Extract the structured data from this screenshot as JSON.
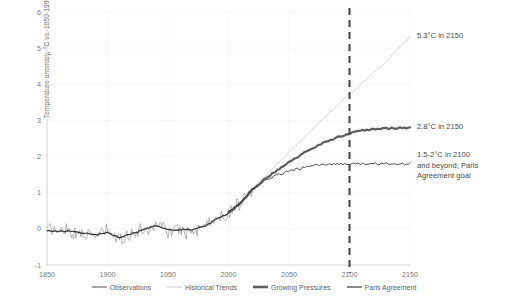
{
  "chart_data": {
    "type": "line",
    "title": "",
    "xlabel": "",
    "ylabel": "Temperature anomaly, °C vs. 1850-1900",
    "xlim": [
      1850,
      2150
    ],
    "ylim": [
      -1,
      6
    ],
    "xticks": [
      1850,
      1900,
      1950,
      2000,
      2050,
      2100,
      2150
    ],
    "yticks": [
      -1,
      0,
      1,
      2,
      3,
      4,
      5,
      6
    ],
    "grid": "faint-horizontal-and-vertical",
    "legend_position": "bottom-center",
    "reference_line": {
      "name": "year-2100-marker",
      "x": 2100,
      "style": "dashed",
      "color": "#4a4a4a"
    },
    "series": [
      {
        "name": "Observations",
        "color": "#8c8c8c",
        "width": 0.6,
        "style": "solid-noisy",
        "x_start": 1850,
        "x_end": 2020,
        "description": "Annual observed global temperature anomaly, noisy",
        "x": [
          1850,
          1855,
          1860,
          1865,
          1870,
          1875,
          1880,
          1885,
          1890,
          1895,
          1900,
          1905,
          1910,
          1915,
          1920,
          1925,
          1930,
          1935,
          1940,
          1945,
          1950,
          1955,
          1960,
          1965,
          1970,
          1975,
          1980,
          1985,
          1990,
          1995,
          2000,
          2005,
          2010,
          2015,
          2020
        ],
        "values": [
          -0.05,
          0.02,
          -0.12,
          0.05,
          -0.08,
          -0.18,
          -0.05,
          -0.22,
          -0.18,
          -0.12,
          -0.02,
          -0.22,
          -0.32,
          -0.18,
          -0.12,
          -0.08,
          0.02,
          -0.05,
          0.18,
          0.12,
          -0.08,
          -0.08,
          0.02,
          -0.12,
          0.05,
          -0.05,
          0.22,
          0.12,
          0.38,
          0.32,
          0.45,
          0.62,
          0.72,
          0.92,
          1.12
        ]
      },
      {
        "name": "Observations smoothed",
        "color": "#3a3a3a",
        "width": 1.3,
        "style": "solid",
        "description": "Smoothed running mean over the observations",
        "x": [
          1850,
          1860,
          1870,
          1880,
          1890,
          1900,
          1910,
          1920,
          1930,
          1940,
          1950,
          1960,
          1970,
          1980,
          1990,
          2000,
          2010,
          2020
        ],
        "values": [
          -0.04,
          -0.06,
          -0.06,
          -0.12,
          -0.16,
          -0.1,
          -0.24,
          -0.14,
          -0.02,
          0.1,
          -0.04,
          -0.02,
          -0.02,
          0.08,
          0.26,
          0.44,
          0.7,
          1.08
        ]
      },
      {
        "name": "Historical Trends",
        "color": "#c9c9c9",
        "width": 0.7,
        "style": "solid",
        "description": "Extrapolated historical trend projection to 2150",
        "x": [
          2000,
          2010,
          2020,
          2030,
          2040,
          2050,
          2060,
          2070,
          2080,
          2090,
          2100,
          2110,
          2120,
          2130,
          2140,
          2150
        ],
        "values": [
          0.45,
          0.72,
          1.1,
          1.45,
          1.78,
          2.12,
          2.45,
          2.78,
          3.1,
          3.42,
          3.72,
          4.02,
          4.32,
          4.62,
          4.98,
          5.3
        ],
        "endpoint_label": "5.3°C in 2150"
      },
      {
        "name": "Growing Pressures",
        "color": "#5e5e5e",
        "width": 2.2,
        "style": "solid",
        "description": "Moderate-mitigation scenario plateauing near 2.8°C",
        "x": [
          2000,
          2010,
          2020,
          2030,
          2040,
          2050,
          2060,
          2070,
          2080,
          2090,
          2100,
          2110,
          2120,
          2130,
          2140,
          2150
        ],
        "values": [
          0.45,
          0.72,
          1.1,
          1.38,
          1.62,
          1.85,
          2.05,
          2.24,
          2.4,
          2.54,
          2.64,
          2.72,
          2.76,
          2.78,
          2.79,
          2.8
        ],
        "endpoint_label": "2.8°C in 2150"
      },
      {
        "name": "Paris Agreement",
        "color": "#3a3a3a",
        "width": 0.9,
        "style": "solid",
        "description": "Paris-compatible pathway stabilising between 1.5 and 2°C",
        "x": [
          2000,
          2010,
          2020,
          2030,
          2040,
          2050,
          2060,
          2070,
          2080,
          2090,
          2100,
          2110,
          2120,
          2130,
          2140,
          2150
        ],
        "values": [
          0.45,
          0.72,
          1.1,
          1.32,
          1.48,
          1.6,
          1.68,
          1.74,
          1.78,
          1.8,
          1.8,
          1.8,
          1.8,
          1.8,
          1.8,
          1.8
        ],
        "endpoint_label": "1.5-2°C in 2100 and beyond, Paris Agreement goal"
      }
    ],
    "annotations": [
      {
        "id": "historical-trends-annotation",
        "text": "5.3°C in 2150",
        "at_x": 2150,
        "at_y": 5.3
      },
      {
        "id": "growing-pressures-annotation",
        "text": "2.8°C in 2150",
        "at_x": 2150,
        "at_y": 2.8
      },
      {
        "id": "paris-agreement-annotation",
        "text": "1.5-2°C in 2100\nand beyond, Paris\nAgreement goal",
        "at_x": 2150,
        "at_y": 1.8
      }
    ],
    "legend": [
      {
        "label": "Observations",
        "color": "#6e6e6e",
        "width": 1.2
      },
      {
        "label": "Historical Trends",
        "color": "#cfcfcf",
        "width": 1.0
      },
      {
        "label": "Growing Pressures",
        "color": "#5e5e5e",
        "width": 2.6
      },
      {
        "label": "Paris Agreement",
        "color": "#3a3a3a",
        "width": 1.2
      }
    ]
  }
}
